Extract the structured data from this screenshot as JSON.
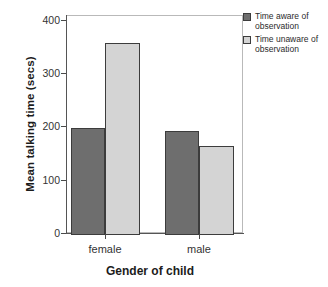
{
  "chart_data": {
    "type": "bar",
    "title": "",
    "xlabel": "Gender of child",
    "ylabel": "Mean talking time (secs)",
    "categories": [
      "female",
      "male"
    ],
    "series": [
      {
        "name": "Time aware of observation",
        "values": [
          205,
          198
        ],
        "color": "#6e6e6e"
      },
      {
        "name": "Time unaware of observation",
        "values": [
          368,
          170
        ],
        "color": "#d4d4d4"
      }
    ],
    "ylim": [
      0,
      420
    ],
    "yticks": [
      0,
      100,
      200,
      300,
      400
    ],
    "ytick_labels": [
      "0",
      "100",
      "200",
      "300",
      "400"
    ],
    "grid": false,
    "legend_position": "top-right"
  },
  "axes": {
    "y_title": "Mean talking time (secs)",
    "x_title": "Gender of child",
    "y_tick_0": "0",
    "y_tick_100": "100",
    "y_tick_200": "200",
    "y_tick_300": "300",
    "y_tick_400": "400",
    "x_cat_0": "female",
    "x_cat_1": "male"
  },
  "legend": {
    "items": [
      {
        "label": "Time aware of observation",
        "swatch": "dark-swatch-icon"
      },
      {
        "label": "Time unaware of observation",
        "swatch": "light-swatch-icon"
      }
    ]
  }
}
